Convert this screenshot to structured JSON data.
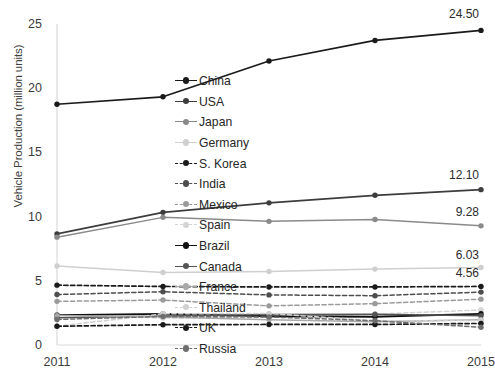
{
  "chart_data": {
    "type": "line",
    "title": "",
    "xlabel": "",
    "ylabel": "Vehicle Production (million units)",
    "categories": [
      "2011",
      "2012",
      "2013",
      "2014",
      "2015"
    ],
    "x": [
      2011,
      2012,
      2013,
      2014,
      2015
    ],
    "ylim": [
      0,
      25
    ],
    "yticks": [
      0,
      5,
      10,
      15,
      20,
      25
    ],
    "grid": false,
    "legend_position": "center",
    "markers": true,
    "series": [
      {
        "name": "China",
        "values": [
          18.75,
          19.33,
          22.12,
          23.72,
          24.5
        ],
        "color": "#1a1a1a",
        "dash": "solid",
        "width": 1.7
      },
      {
        "name": "USA",
        "values": [
          8.65,
          10.33,
          11.07,
          11.66,
          12.1
        ],
        "color": "#3d3d3d",
        "dash": "solid",
        "width": 1.7
      },
      {
        "name": "Japan",
        "values": [
          8.4,
          9.94,
          9.63,
          9.77,
          9.28
        ],
        "color": "#8a8a8a",
        "dash": "solid",
        "width": 1.5
      },
      {
        "name": "Germany",
        "values": [
          6.15,
          5.65,
          5.72,
          5.91,
          6.03
        ],
        "color": "#cfcfcf",
        "dash": "solid",
        "width": 1.5
      },
      {
        "name": "S. Korea",
        "values": [
          4.66,
          4.56,
          4.52,
          4.52,
          4.56
        ],
        "color": "#1a1a1a",
        "dash": "dashed",
        "width": 1.7
      },
      {
        "name": "India",
        "values": [
          3.93,
          4.15,
          3.9,
          3.84,
          4.12
        ],
        "color": "#4d4d4d",
        "dash": "dashed",
        "width": 1.5
      },
      {
        "name": "Mexico",
        "values": [
          3.4,
          3.5,
          3.05,
          3.22,
          3.57
        ],
        "color": "#9a9a9a",
        "dash": "dashed",
        "width": 1.5
      },
      {
        "name": "Spain",
        "values": [
          2.37,
          2.1,
          2.16,
          2.4,
          2.73
        ],
        "color": "#d4d4d4",
        "dash": "dashed",
        "width": 1.5
      },
      {
        "name": "Brazil",
        "values": [
          2.33,
          2.42,
          2.24,
          2.2,
          2.43
        ],
        "color": "#111111",
        "dash": "solid",
        "width": 1.8
      },
      {
        "name": "Canada",
        "values": [
          2.13,
          2.26,
          2.38,
          2.39,
          2.28
        ],
        "color": "#555555",
        "dash": "solid",
        "width": 1.5
      },
      {
        "name": "France",
        "values": [
          2.29,
          2.19,
          1.97,
          1.82,
          1.97
        ],
        "color": "#a8a8a8",
        "dash": "solid",
        "width": 1.5
      },
      {
        "name": "Thailand",
        "values": [
          1.46,
          2.43,
          2.46,
          1.88,
          1.91
        ],
        "color": "#d0d0d0",
        "dash": "dashed",
        "width": 1.5
      },
      {
        "name": "UK",
        "values": [
          1.46,
          1.58,
          1.6,
          1.6,
          1.68
        ],
        "color": "#1a1a1a",
        "dash": "dashed",
        "width": 1.7
      },
      {
        "name": "Russia",
        "values": [
          1.99,
          2.23,
          2.18,
          1.89,
          1.38
        ],
        "color": "#6e6e6e",
        "dash": "dashed",
        "width": 1.5
      }
    ],
    "data_labels": [
      {
        "series": "China",
        "value": "24.50",
        "at_x": 2015
      },
      {
        "series": "USA",
        "value": "12.10",
        "at_x": 2015
      },
      {
        "series": "Japan",
        "value": "9.28",
        "at_x": 2015
      },
      {
        "series": "Germany",
        "value": "6.03",
        "at_x": 2015
      },
      {
        "series": "S. Korea",
        "value": "4.56",
        "at_x": 2015
      }
    ]
  },
  "legend": {
    "items": [
      {
        "label": "China"
      },
      {
        "label": "USA"
      },
      {
        "label": "Japan"
      },
      {
        "label": "Germany"
      },
      {
        "label": "S. Korea"
      },
      {
        "label": "India"
      },
      {
        "label": "Mexico"
      },
      {
        "label": "Spain"
      },
      {
        "label": "Brazil"
      },
      {
        "label": "Canada"
      },
      {
        "label": "France"
      },
      {
        "label": "Thailand"
      },
      {
        "label": "UK"
      },
      {
        "label": "Russia"
      }
    ]
  },
  "axes": {
    "y_title": "Vehicle Production (million units)",
    "y_ticks": [
      "25",
      "20",
      "15",
      "10",
      "5",
      "0"
    ],
    "x_ticks": [
      "2011",
      "2012",
      "2013",
      "2014",
      "2015"
    ]
  }
}
